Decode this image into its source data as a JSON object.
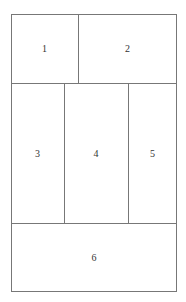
{
  "diagram": {
    "type": "layout-grid",
    "regions": [
      {
        "id": 1,
        "label": "1"
      },
      {
        "id": 2,
        "label": "2"
      },
      {
        "id": 3,
        "label": "3"
      },
      {
        "id": 4,
        "label": "4"
      },
      {
        "id": 5,
        "label": "5"
      },
      {
        "id": 6,
        "label": "6"
      }
    ],
    "colors": {
      "border": "#777777",
      "background": "#ffffff",
      "text": "#333333"
    }
  }
}
